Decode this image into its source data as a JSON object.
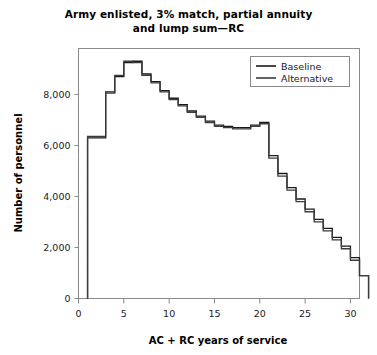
{
  "chart_data": {
    "type": "line",
    "title": "Army enlisted, 3% match, partial annuity and lump sum—RC",
    "title_line1": "Army enlisted, 3% match, partial annuity",
    "title_line2": "and lump sum—RC",
    "xlabel": "AC + RC years of service",
    "ylabel": "Number of personnel",
    "xlim": [
      0,
      31
    ],
    "ylim": [
      0,
      9800
    ],
    "xticks": [
      0,
      5,
      10,
      15,
      20,
      25,
      30
    ],
    "xticklabels": [
      "0",
      "5",
      "10",
      "15",
      "20",
      "25",
      "30"
    ],
    "yticks": [
      0,
      2000,
      4000,
      6000,
      8000
    ],
    "yticklabels": [
      "0",
      "2,000",
      "4,000",
      "6,000",
      "8,000"
    ],
    "grid": false,
    "legend_position": "top-right",
    "drawstyle": "steps-post",
    "x": [
      1,
      2,
      3,
      4,
      5,
      6,
      7,
      8,
      9,
      10,
      11,
      12,
      13,
      14,
      15,
      16,
      17,
      18,
      19,
      20,
      21,
      22,
      23,
      24,
      25,
      26,
      27,
      28,
      29,
      30,
      31
    ],
    "series": [
      {
        "name": "Baseline",
        "color": "#1a1a1a",
        "values": [
          6300,
          6300,
          8100,
          8700,
          9250,
          9300,
          8800,
          8500,
          8150,
          7850,
          7600,
          7350,
          7150,
          6950,
          6800,
          6750,
          6700,
          6700,
          6800,
          6900,
          5600,
          4900,
          4350,
          3900,
          3500,
          3100,
          2750,
          2400,
          2050,
          1600,
          900
        ]
      },
      {
        "name": "Alternative",
        "color": "#3c3c3c",
        "values": [
          6350,
          6350,
          8050,
          8750,
          9300,
          9250,
          8750,
          8450,
          8100,
          7800,
          7550,
          7300,
          7100,
          6900,
          6750,
          6700,
          6650,
          6650,
          6750,
          6850,
          5500,
          4800,
          4250,
          3800,
          3400,
          3000,
          2650,
          2300,
          1950,
          1500,
          900
        ]
      }
    ]
  },
  "legend": {
    "items": [
      {
        "label": "Baseline"
      },
      {
        "label": "Alternative"
      }
    ]
  },
  "axes": {
    "x_label": "AC + RC years of service",
    "y_label": "Number of personnel"
  }
}
